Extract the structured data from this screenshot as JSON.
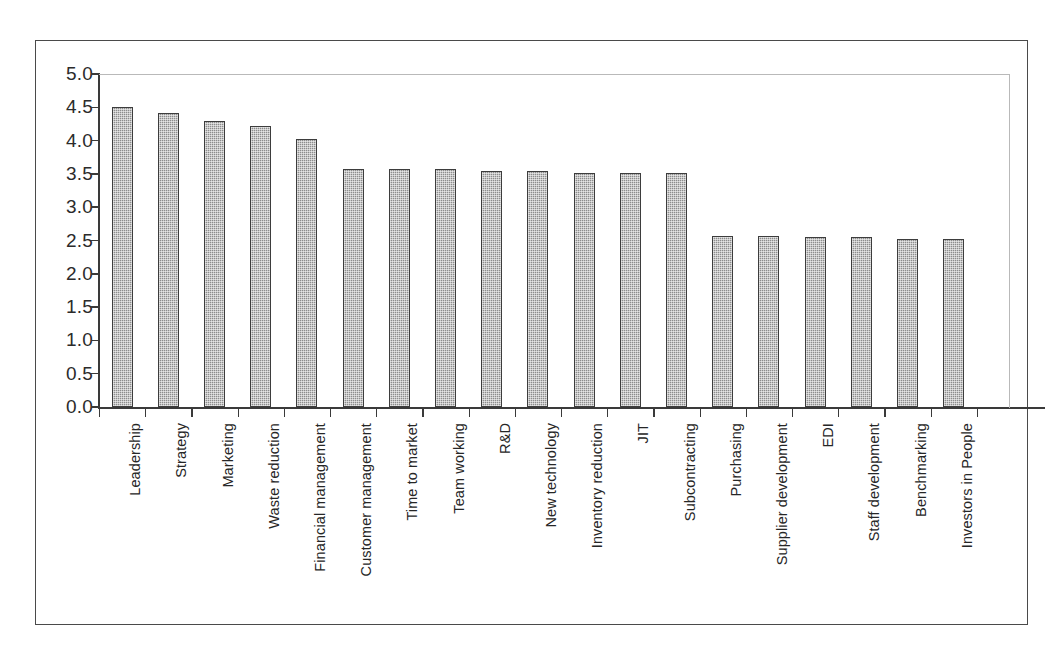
{
  "chart_data": {
    "type": "bar",
    "title": "",
    "subtitle": "",
    "xlabel": "",
    "ylabel": "",
    "ylim": [
      0.0,
      5.0
    ],
    "ytick_labels": [
      "5.0",
      "4.5",
      "4.0",
      "3.5",
      "3.0",
      "2.5",
      "2.0",
      "1.5",
      "1.0",
      "0.5",
      "0.0"
    ],
    "ytick_values": [
      5.0,
      4.5,
      4.0,
      3.5,
      3.0,
      2.5,
      2.0,
      1.5,
      1.0,
      0.5,
      0.0
    ],
    "grid": false,
    "legend": false,
    "legend_position": "none",
    "categories": [
      "Leadership",
      "Strategy",
      "Marketing",
      "Waste reduction",
      "Financial management",
      "Customer management",
      "Time to market",
      "Team working",
      "R&D",
      "New technology",
      "Inventory reduction",
      "JIT",
      "Subcontracting",
      "Purchasing",
      "Supplier development",
      "EDI",
      "Staff development",
      "Benchmarking",
      "Investors in People"
    ],
    "values": [
      4.5,
      4.42,
      4.3,
      4.22,
      4.02,
      3.57,
      3.57,
      3.57,
      3.55,
      3.55,
      3.52,
      3.52,
      3.52,
      2.57,
      2.57,
      2.55,
      2.56,
      2.53,
      2.53
    ]
  },
  "style": {
    "bar_fill": "#8d8d8d",
    "bar_border": "#3d3d3d",
    "axis_color": "#3a3a3a",
    "plot_border": "#b9b9b9",
    "frame_border": "#4a4a4a",
    "text_color": "#262626",
    "background": "#ffffff"
  }
}
